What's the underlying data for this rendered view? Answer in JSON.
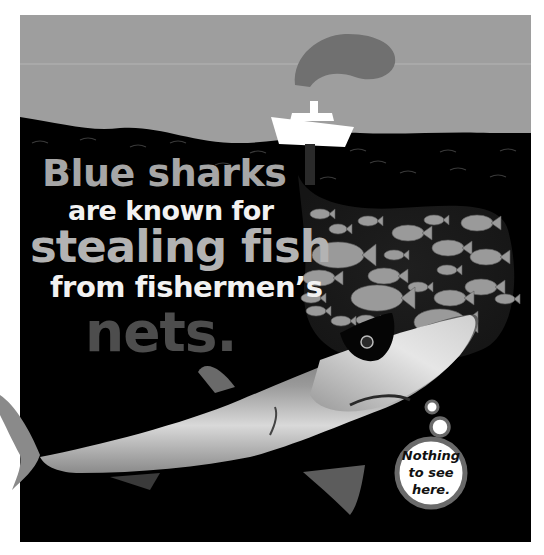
{
  "headline": {
    "line1": "Blue sharks",
    "line2": "are known for",
    "line3": "stealing fish",
    "line4": "from fishermen’s",
    "line5": "nets."
  },
  "thought_bubble": {
    "lines": [
      "Nothing",
      "to see",
      "here."
    ]
  },
  "colors": {
    "sky": "#9e9e9e",
    "sea": "#000000",
    "smoke": "#6f6f6f",
    "ship": "#ffffff",
    "fish": "#9a9a9a",
    "net": "#1c1c1c",
    "headline_grey": "#a6a6a6",
    "headline_white": "#f2f2f2",
    "headline_dark": "#4d4d4d"
  }
}
